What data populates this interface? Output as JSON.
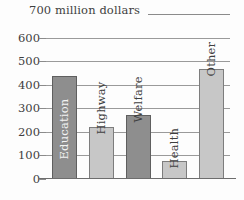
{
  "chart_data": {
    "type": "bar",
    "title": "700 million dollars",
    "xlabel": "",
    "ylabel": "",
    "unit_caption": "700 million dollars",
    "categories": [
      "Education",
      "Highway",
      "Welfare",
      "Health",
      "Other"
    ],
    "values": [
      435,
      220,
      270,
      75,
      465
    ],
    "ylim": [
      0,
      700
    ],
    "ytick_labels": [
      "0",
      "100",
      "200",
      "300",
      "400",
      "500",
      "600"
    ],
    "ytick_values": [
      0,
      100,
      200,
      300,
      400,
      500,
      600
    ],
    "grid": true,
    "legend": "none",
    "series_colors": [
      "#8e8e8e",
      "#c7c7c7",
      "#8e8e8e",
      "#c7c7c7",
      "#c7c7c7"
    ],
    "bar_shades": [
      "dark",
      "light",
      "dark",
      "light",
      "light"
    ],
    "label_placement": [
      "inside",
      "above",
      "above",
      "above",
      "above"
    ],
    "background_color": "#fdfdfd",
    "gridline_color": "#9a9a9a",
    "axis_color": "#6d6d6d",
    "text_color": "#3f3f3f"
  }
}
